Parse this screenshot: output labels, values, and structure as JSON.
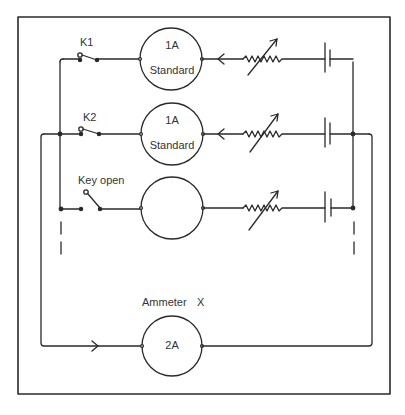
{
  "diagram": {
    "colors": {
      "line": "#2a2a2a",
      "text": "#333333",
      "background": "#ffffff"
    },
    "branches": [
      {
        "key_label": "K1",
        "key_state": "closed",
        "meter_label": "1A",
        "meter_sub": "Standard",
        "current_arrow": "left"
      },
      {
        "key_label": "K2",
        "key_state": "closed",
        "meter_label": "1A",
        "meter_sub": "Standard",
        "current_arrow": "left"
      },
      {
        "key_label": "Key open",
        "key_state": "open",
        "meter_label": "",
        "meter_sub": "",
        "current_arrow": ""
      }
    ],
    "ammeter_under_test": {
      "title": "Ammeter",
      "id_label": "X",
      "meter_label": "2A",
      "current_arrow": "right"
    },
    "components": {
      "rheostat_icon": "variable-resistor",
      "battery_icon": "cell",
      "continuation": "dashed-lines-indicating-more-branches"
    }
  }
}
